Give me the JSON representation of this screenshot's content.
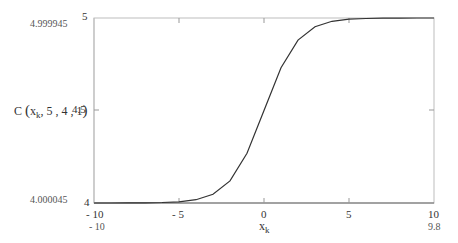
{
  "chart_data": {
    "type": "line",
    "title": "",
    "xlabel": "x_k",
    "ylabel": "C(x_k, 5, 4, 1)",
    "xlim": [
      -10,
      10
    ],
    "ylim": [
      4,
      5
    ],
    "grid": false,
    "x_ticks": [
      "-10",
      "-5",
      "0",
      "5",
      "10"
    ],
    "y_ticks": [
      "4",
      "4.5",
      "5"
    ],
    "y_range_markers": {
      "top": "4.999945",
      "bottom": "4.000045"
    },
    "x_range_markers": {
      "left": "-10",
      "right": "9.8"
    },
    "series": [
      {
        "name": "C(x_k,5,4,1)",
        "x": [
          -10,
          -9,
          -8,
          -7,
          -6,
          -5,
          -4,
          -3,
          -2,
          -1,
          0,
          1,
          2,
          3,
          4,
          5,
          6,
          7,
          8,
          9,
          10
        ],
        "values": [
          4.000045,
          4.000123,
          4.000335,
          4.000911,
          4.002473,
          4.006693,
          4.017986,
          4.047426,
          4.119203,
          4.268941,
          4.5,
          4.731059,
          4.880797,
          4.952574,
          4.982014,
          4.993307,
          4.997527,
          4.999089,
          4.999665,
          4.999877,
          4.999955
        ]
      }
    ]
  },
  "labels": {
    "y_axis_name": "C",
    "y_axis_args_pre": "x",
    "y_axis_sub": "k",
    "y_axis_args_post": ", 5 , 4 , 1",
    "x_axis_name": "x",
    "x_axis_sub": "k",
    "y_top_marker": "4.999945",
    "y_bottom_marker": "4.000045",
    "x_left_marker": "- 10",
    "x_right_marker": "9.8",
    "ytick_5": "5",
    "ytick_45": "4.5",
    "ytick_4": "4",
    "xtick_m10": "- 10",
    "xtick_m5": "- 5",
    "xtick_0": "0",
    "xtick_5": "5",
    "xtick_10": "10"
  }
}
